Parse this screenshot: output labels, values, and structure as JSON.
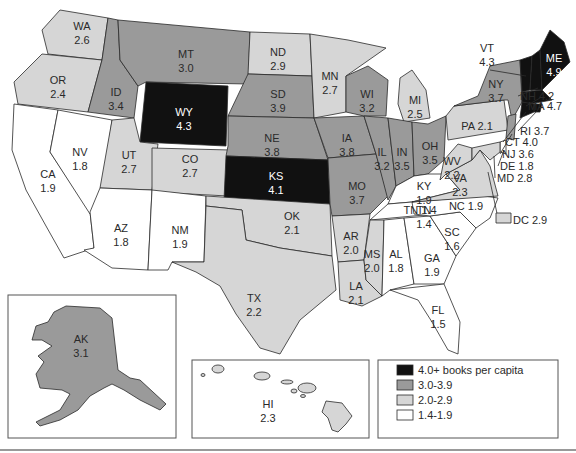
{
  "colors": {
    "tier4": "#111111",
    "tier3": "#9a9a9a",
    "tier2": "#d6d6d6",
    "tier1": "#ffffff"
  },
  "legend": {
    "items": [
      {
        "label": "4.0+ books per capita",
        "tier": "tier4"
      },
      {
        "label": "3.0-3.9",
        "tier": "tier3"
      },
      {
        "label": "2.0-2.9",
        "tier": "tier2"
      },
      {
        "label": "1.4-1.9",
        "tier": "tier1"
      }
    ]
  },
  "chart_data": {
    "type": "choropleth",
    "title": "",
    "legend_title": "books per capita",
    "bins": [
      "4.0+",
      "3.0-3.9",
      "2.0-2.9",
      "1.4-1.9"
    ],
    "states": {
      "WA": 2.6,
      "OR": 2.4,
      "CA": 1.9,
      "NV": 1.8,
      "ID": 3.4,
      "MT": 3.0,
      "WY": 4.3,
      "UT": 2.7,
      "CO": 2.7,
      "AZ": 1.8,
      "NM": 1.9,
      "ND": 2.9,
      "SD": 3.9,
      "NE": 3.8,
      "KS": 4.1,
      "OK": 2.1,
      "TX": 2.2,
      "MN": 2.7,
      "IA": 3.8,
      "MO": 3.7,
      "AR": 2.0,
      "LA": 2.1,
      "WI": 3.2,
      "IL": 3.2,
      "MI": 2.5,
      "IN": 3.5,
      "OH": 3.5,
      "KY": 1.9,
      "TN": 1.4,
      "MS": 2.0,
      "AL": 1.8,
      "GA": 1.9,
      "FL": 1.5,
      "SC": 1.6,
      "NC": 1.9,
      "VA": 2.3,
      "WV": 2.2,
      "PA": 2.1,
      "NY": 3.7,
      "VT": 4.3,
      "NH": 4.2,
      "ME": 4.9,
      "MA": 4.7,
      "RI": 3.7,
      "CT": 4.0,
      "NJ": 3.6,
      "DE": 1.8,
      "MD": 2.8,
      "DC": 2.9,
      "AK": 3.1,
      "HI": 2.3
    }
  },
  "states": [
    {
      "abbr": "WA",
      "value": "2.6",
      "tier": "tier2",
      "pts": "60,10 108,18 102,60 48,54 42,30",
      "lx": 82,
      "ly": 30
    },
    {
      "abbr": "OR",
      "value": "2.4",
      "tier": "tier2",
      "pts": "42,54 102,60 88,112 18,104 14,82",
      "lx": 58,
      "ly": 84
    },
    {
      "abbr": "CA",
      "value": "1.9",
      "tier": "tier1",
      "pts": "14,104 58,110 50,152 90,212 94,248 64,258 46,226 26,190 12,150",
      "lx": 48,
      "ly": 178
    },
    {
      "abbr": "NV",
      "value": "1.8",
      "tier": "tier1",
      "pts": "58,110 112,120 100,210 90,214 50,152",
      "lx": 80,
      "ly": 156
    },
    {
      "abbr": "ID",
      "value": "3.4",
      "tier": "tier3",
      "pts": "108,18 118,20 120,60 138,86 134,118 88,112 102,60",
      "lx": 116,
      "ly": 96
    },
    {
      "abbr": "MT",
      "value": "3.0",
      "tier": "tier3",
      "pts": "118,20 250,32 248,84 146,82 138,86 120,60",
      "lx": 186,
      "ly": 58
    },
    {
      "abbr": "WY",
      "value": "4.3",
      "tier": "tier4",
      "pts": "146,82 228,86 226,146 140,142",
      "lx": 184,
      "ly": 116
    },
    {
      "abbr": "UT",
      "value": "2.7",
      "tier": "tier2",
      "pts": "112,120 134,118 140,142 158,144 152,190 100,188",
      "lx": 129,
      "ly": 159
    },
    {
      "abbr": "CO",
      "value": "2.7",
      "tier": "tier2",
      "pts": "152,148 230,150 228,196 152,192",
      "lx": 190,
      "ly": 163
    },
    {
      "abbr": "AZ",
      "value": "1.8",
      "tier": "tier1",
      "pts": "100,188 152,190 148,270 112,268 84,250 94,248 90,212",
      "lx": 121,
      "ly": 232
    },
    {
      "abbr": "NM",
      "value": "1.9",
      "tier": "tier1",
      "pts": "152,190 206,196 204,262 172,262 168,270 148,270",
      "lx": 180,
      "ly": 234
    },
    {
      "abbr": "ND",
      "value": "2.9",
      "tier": "tier2",
      "pts": "250,32 310,34 312,76 248,74",
      "lx": 278,
      "ly": 56
    },
    {
      "abbr": "SD",
      "value": "3.9",
      "tier": "tier3",
      "pts": "248,74 312,76 314,118 228,116",
      "lx": 278,
      "ly": 98
    },
    {
      "abbr": "NE",
      "value": "3.8",
      "tier": "tier3",
      "pts": "228,116 314,118 328,160 226,156 228,146",
      "lx": 272,
      "ly": 142
    },
    {
      "abbr": "KS",
      "value": "4.1",
      "tier": "tier4",
      "pts": "226,156 328,160 330,204 224,200",
      "lx": 276,
      "ly": 180
    },
    {
      "abbr": "OK",
      "value": "2.1",
      "tier": "tier2",
      "pts": "206,196 330,204 332,256 280,248 246,240 242,210 206,206",
      "lx": 292,
      "ly": 220
    },
    {
      "abbr": "TX",
      "value": "2.2",
      "tier": "tier2",
      "pts": "206,206 242,210 246,240 280,248 332,256 336,290 300,320 280,354 260,348 236,314 220,286 196,272 172,262 204,262",
      "lx": 254,
      "ly": 302
    },
    {
      "abbr": "MN",
      "value": "2.7",
      "tier": "tier2",
      "pts": "310,34 348,40 386,48 346,76 346,112 314,118 312,76",
      "lx": 330,
      "ly": 80
    },
    {
      "abbr": "IA",
      "value": "3.8",
      "tier": "tier3",
      "pts": "314,118 364,116 376,154 328,158",
      "lx": 347,
      "ly": 142
    },
    {
      "abbr": "MO",
      "value": "3.7",
      "tier": "tier3",
      "pts": "328,158 376,154 388,196 370,214 332,216 330,204",
      "lx": 357,
      "ly": 190
    },
    {
      "abbr": "AR",
      "value": "2.0",
      "tier": "tier2",
      "pts": "332,216 370,214 364,260 338,262",
      "lx": 351,
      "ly": 240
    },
    {
      "abbr": "LA",
      "value": "2.1",
      "tier": "tier2",
      "pts": "338,262 364,260 366,280 382,296 362,306 340,300",
      "lx": 356,
      "ly": 290
    },
    {
      "abbr": "WI",
      "value": "3.2",
      "tier": "tier3",
      "pts": "346,76 368,66 388,80 386,116 364,116 346,112",
      "lx": 367,
      "ly": 98
    },
    {
      "abbr": "IL",
      "value": "3.2",
      "tier": "tier3",
      "pts": "364,116 388,118 396,186 388,200 376,154",
      "lx": 382,
      "ly": 156
    },
    {
      "abbr": "MI",
      "value": "2.5",
      "tier": "tier2",
      "pts": "400,78 412,70 426,90 430,118 404,122 398,104",
      "lx": 415,
      "ly": 104
    },
    {
      "abbr": "IN",
      "value": "3.5",
      "tier": "tier3",
      "pts": "388,118 412,122 414,176 396,186",
      "lx": 402,
      "ly": 156
    },
    {
      "abbr": "OH",
      "value": "3.5",
      "tier": "tier3",
      "pts": "412,122 428,124 446,116 444,160 428,174 414,176",
      "lx": 430,
      "ly": 150
    },
    {
      "abbr": "KY",
      "value": "1.9",
      "tier": "tier1",
      "pts": "396,186 414,176 428,174 446,174 460,190 412,202 388,204",
      "lx": 424,
      "ly": 190
    },
    {
      "abbr": "TN",
      "value": "1.4",
      "tier": "tier1",
      "pts": "388,204 412,202 484,196 478,210 370,220",
      "lx": 424,
      "ly": 214
    },
    {
      "abbr": "MS",
      "value": "2.0",
      "tier": "tier2",
      "pts": "370,220 384,220 382,296 366,280 364,260",
      "lx": 372,
      "ly": 258
    },
    {
      "abbr": "AL",
      "value": "1.8",
      "tier": "tier1",
      "pts": "384,220 404,218 414,284 390,290 382,296",
      "lx": 396,
      "ly": 258
    },
    {
      "abbr": "GA",
      "value": "1.9",
      "tier": "tier1",
      "pts": "404,218 430,216 456,256 444,284 414,284",
      "lx": 432,
      "ly": 262
    },
    {
      "abbr": "FL",
      "value": "1.5",
      "tier": "tier1",
      "pts": "390,290 444,284 460,322 458,354 448,350 432,322 418,300",
      "lx": 438,
      "ly": 314
    },
    {
      "abbr": "SC",
      "value": "1.6",
      "tier": "tier1",
      "pts": "430,216 460,212 476,228 456,256",
      "lx": 452,
      "ly": 236
    },
    {
      "abbr": "NC",
      "value": "1.9",
      "tier": "tier1",
      "pts": "412,202 484,196 498,198 490,218 476,228 460,212 430,216 414,214",
      "lx": 0,
      "ly": 0
    },
    {
      "abbr": "VA",
      "value": "2.3",
      "tier": "tier2",
      "pts": "446,174 472,160 480,150 490,166 498,196 412,202 460,190",
      "lx": 460,
      "ly": 182
    },
    {
      "abbr": "WV",
      "value": "2.2",
      "tier": "tier2",
      "pts": "444,160 458,144 472,148 472,160 446,174 440,180",
      "lx": 452,
      "ly": 165
    },
    {
      "abbr": "PA",
      "value": "2.1",
      "tier": "tier2",
      "pts": "446,116 454,106 504,100 508,130 448,140",
      "lx": 0,
      "ly": 0
    },
    {
      "abbr": "NY",
      "value": "3.7",
      "tier": "tier3",
      "pts": "454,106 478,96 490,66 520,60 522,102 512,120 508,100 504,100",
      "lx": 496,
      "ly": 88
    },
    {
      "abbr": "VT",
      "value": "4.3",
      "tier": "tier4",
      "pts": "520,60 532,56 530,90 522,92",
      "lx": 0,
      "ly": 0
    },
    {
      "abbr": "NH",
      "value": "4.2",
      "tier": "tier4",
      "pts": "532,56 540,50 542,90 530,90",
      "lx": 0,
      "ly": 0
    },
    {
      "abbr": "ME",
      "value": "4.9",
      "tier": "tier4",
      "pts": "540,50 550,30 564,42 570,62 552,80 542,90",
      "lx": 554,
      "ly": 62
    },
    {
      "abbr": "MA",
      "value": "4.7",
      "tier": "tier4",
      "pts": "522,92 542,90 552,100 530,104 522,102",
      "lx": 0,
      "ly": 0
    },
    {
      "abbr": "RI",
      "value": "3.7",
      "tier": "tier4",
      "pts": "534,104 542,104 540,112 534,112",
      "lx": 0,
      "ly": 0
    },
    {
      "abbr": "CT",
      "value": "4.0",
      "tier": "tier4",
      "pts": "522,102 534,104 534,112 520,118",
      "lx": 0,
      "ly": 0
    },
    {
      "abbr": "NJ",
      "value": "3.6",
      "tier": "tier3",
      "pts": "508,116 516,114 514,140 506,138",
      "lx": 0,
      "ly": 0
    },
    {
      "abbr": "DE",
      "value": "1.8",
      "tier": "tier1",
      "pts": "500,142 506,140 506,154 500,152",
      "lx": 0,
      "ly": 0
    },
    {
      "abbr": "MD",
      "value": "2.8",
      "tier": "tier2",
      "pts": "472,148 500,142 500,152 490,160 480,150 472,160",
      "lx": 0,
      "ly": 0
    }
  ],
  "callouts": [
    {
      "text": "VT 4.3",
      "lines": [
        "VT",
        "4.3"
      ],
      "x": 487,
      "y": 52,
      "lx1": 490,
      "ly1": 70,
      "lx2": 526,
      "ly2": 76
    },
    {
      "text": "NH 4.2",
      "x": 520,
      "y": 100,
      "lx1": 518,
      "ly1": 96,
      "lx2": 538,
      "ly2": 88
    },
    {
      "text": "MA 4.7",
      "x": 528,
      "y": 110,
      "lx1": 526,
      "ly1": 106,
      "lx2": 540,
      "ly2": 98
    },
    {
      "text": "RI 3.7",
      "x": 520,
      "y": 135,
      "lx1": 518,
      "ly1": 131,
      "lx2": 538,
      "ly2": 110
    },
    {
      "text": "CT 4.0",
      "x": 505,
      "y": 146,
      "lx1": 503,
      "ly1": 142,
      "lx2": 526,
      "ly2": 112
    },
    {
      "text": "NJ 3.6",
      "x": 502,
      "y": 158,
      "lx1": 500,
      "ly1": 154,
      "lx2": 512,
      "ly2": 134
    },
    {
      "text": "DE 1.8",
      "x": 500,
      "y": 170,
      "lx1": 498,
      "ly1": 166,
      "lx2": 504,
      "ly2": 150
    },
    {
      "text": "MD 2.8",
      "x": 497,
      "y": 182,
      "lx1": 495,
      "ly1": 178,
      "lx2": 494,
      "ly2": 156
    },
    {
      "text": "PA 2.1",
      "x": 477,
      "y": 130
    },
    {
      "text": "NC 1.9",
      "x": 466,
      "y": 210
    },
    {
      "text": "TN 1.4",
      "x": 420,
      "y": 214
    }
  ],
  "dc": {
    "text": "DC 2.9",
    "x": 513,
    "y": 224
  },
  "alaska": {
    "abbr": "AK",
    "value": "3.1"
  },
  "hawaii": {
    "abbr": "HI",
    "value": "2.3"
  }
}
